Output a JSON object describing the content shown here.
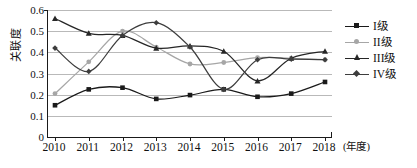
{
  "chart_data": {
    "type": "line",
    "title": "",
    "xlabel": "(年度)",
    "ylabel": "关联度",
    "x": [
      2010,
      2011,
      2012,
      2013,
      2014,
      2015,
      2016,
      2017,
      2018
    ],
    "xtick_labels": [
      "2010",
      "2011",
      "2012",
      "2013",
      "2014",
      "2015",
      "2016",
      "2017",
      "2018"
    ],
    "ytick_labels": [
      "0",
      "0.1",
      "0.2",
      "0.3",
      "0.4",
      "0.5",
      "0.6"
    ],
    "ytick_values": [
      0,
      0.1,
      0.2,
      0.3,
      0.4,
      0.5,
      0.6
    ],
    "ylim": [
      0,
      0.6
    ],
    "xlim": [
      2010,
      2018
    ],
    "grid": "horizontal",
    "smoothed": true,
    "legend_position": "right",
    "series": [
      {
        "name": "I级",
        "marker": "square",
        "color": "#1a1a1a",
        "values": [
          0.15,
          0.225,
          0.233,
          0.18,
          0.198,
          0.225,
          0.19,
          0.205,
          0.26
        ]
      },
      {
        "name": "II级",
        "marker": "dot",
        "color": "#a6a6a6",
        "values": [
          0.205,
          0.355,
          0.5,
          0.425,
          0.345,
          0.352,
          0.375,
          0.372,
          0.365
        ]
      },
      {
        "name": "III级",
        "marker": "triangle",
        "color": "#262626",
        "values": [
          0.56,
          0.49,
          0.48,
          0.42,
          0.43,
          0.405,
          0.265,
          0.372,
          0.405
        ]
      },
      {
        "name": "IV级",
        "marker": "diamond",
        "color": "#3d3d3d",
        "values": [
          0.42,
          0.31,
          0.48,
          0.54,
          0.425,
          0.225,
          0.365,
          0.368,
          0.365
        ]
      }
    ]
  },
  "legend": {
    "items": [
      {
        "label": "I级"
      },
      {
        "label": "II级"
      },
      {
        "label": "III级"
      },
      {
        "label": "IV级"
      }
    ]
  },
  "axes": {
    "y_title": "关联度",
    "x_unit": "(年度)"
  },
  "colors": {
    "axis": "#1a1a1a",
    "grid": "#b9b9b9",
    "series_1": "#1a1a1a",
    "series_2": "#a6a6a6",
    "series_3": "#262626",
    "series_4": "#3d3d3d",
    "background": "#ffffff"
  }
}
